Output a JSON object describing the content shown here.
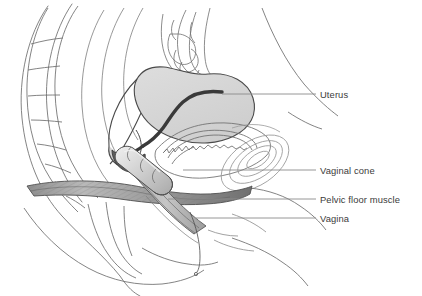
{
  "figure": {
    "background_color": "#ffffff",
    "line_color": "#6e6e6e",
    "dark_line_color": "#3a3a3a",
    "leader_line_color": "#8a8a8a",
    "text_color": "#3b3b3b"
  },
  "labels": [
    {
      "id": "uterus",
      "text": "Uterus",
      "text_x": 320,
      "text_y": 98,
      "leader_x1": 222,
      "leader_y1": 94,
      "leader_x2": 316,
      "leader_y2": 94
    },
    {
      "id": "vaginal-cone",
      "text": "Vaginal cone",
      "text_x": 320,
      "text_y": 174,
      "leader_x1": 183,
      "leader_y1": 170,
      "leader_x2": 316,
      "leader_y2": 170
    },
    {
      "id": "pelvic-floor-muscle",
      "text": "Pelvic floor muscle",
      "text_x": 320,
      "text_y": 203,
      "leader_x1": 168,
      "leader_y1": 199,
      "leader_x2": 316,
      "leader_y2": 199
    },
    {
      "id": "vagina",
      "text": "Vagina",
      "text_x": 320,
      "text_y": 222,
      "leader_x1": 196,
      "leader_y1": 218,
      "leader_x2": 316,
      "leader_y2": 218
    }
  ],
  "structures": [
    {
      "id": "sacrum",
      "name": "sacrum-and-coccyx",
      "fill": "none"
    },
    {
      "id": "uterus-body",
      "name": "uterus",
      "fill": "#d4d4d4"
    },
    {
      "id": "endometrial-cavity",
      "name": "endometrial-cavity",
      "fill": "#3a3a3a"
    },
    {
      "id": "cervix",
      "name": "cervix",
      "fill": "#707070"
    },
    {
      "id": "bladder",
      "name": "bladder",
      "fill": "none"
    },
    {
      "id": "pubic-bone",
      "name": "pubic-bone",
      "fill": "none"
    },
    {
      "id": "bowel",
      "name": "bowel-loop",
      "fill": "none"
    },
    {
      "id": "vaginal-cone-device",
      "name": "vaginal-cone-device",
      "fill": "#cfcfcf"
    },
    {
      "id": "pelvic-floor-band",
      "name": "pelvic-floor-muscle-band",
      "fill": "#9a9a9a"
    },
    {
      "id": "vaginal-canal",
      "name": "vaginal-canal",
      "fill": "#bdbdbd"
    },
    {
      "id": "rectum",
      "name": "rectum",
      "fill": "none"
    },
    {
      "id": "retrieval-string",
      "name": "cone-retrieval-string",
      "fill": "none"
    }
  ]
}
